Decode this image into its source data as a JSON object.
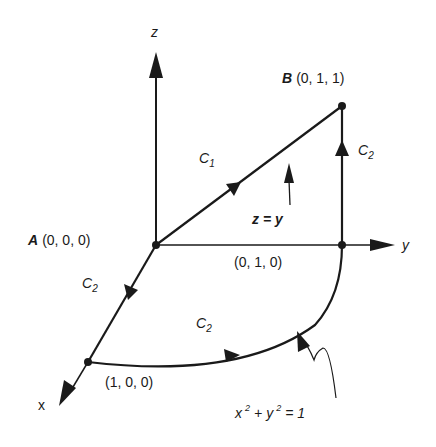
{
  "diagram": {
    "type": "3d-line-integral-paths",
    "axes": {
      "x_label": "x",
      "y_label": "y",
      "z_label": "z"
    },
    "points": {
      "A": {
        "name": "A",
        "coords": "(0, 0, 0)"
      },
      "B": {
        "name": "B",
        "coords": "(0, 1, 1)"
      },
      "P_y": {
        "coords": "(0, 1, 0)"
      },
      "P_x": {
        "coords": "(1, 0, 0)"
      }
    },
    "curves": {
      "c1": {
        "label_main": "C",
        "label_sub": "1",
        "description": "Straight line from A to B in plane z = y"
      },
      "c2_x": {
        "label_main": "C",
        "label_sub": "2",
        "description": "Along x-axis from A to (1,0,0)"
      },
      "c2_arc": {
        "label_main": "C",
        "label_sub": "2",
        "description": "Quarter circle from (1,0,0) to (0,1,0)"
      },
      "c2_up": {
        "label_main": "C",
        "label_sub": "2",
        "description": "Vertical from (0,1,0) to B"
      }
    },
    "annotations": {
      "plane_label": "z = y",
      "circle_eq": {
        "x": "x",
        "x_exp": "2",
        "plus": "+",
        "y": "y",
        "y_exp": "2",
        "rhs": "= 1"
      }
    },
    "colors": {
      "ink": "#1a1a1a",
      "background": "#ffffff"
    }
  }
}
